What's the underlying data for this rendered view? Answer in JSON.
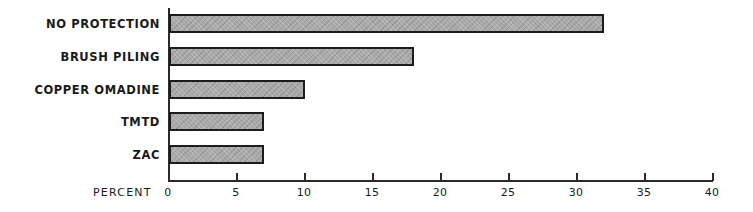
{
  "chart_data": {
    "type": "bar",
    "orientation": "horizontal",
    "title": "",
    "categories": [
      "NO PROTECTION",
      "BRUSH PILING",
      "COPPER OMADINE",
      "TMTD",
      "ZAC"
    ],
    "values": [
      32,
      18,
      10,
      7,
      7
    ],
    "xlabel": "PERCENT",
    "ylabel": "",
    "xlim": [
      0,
      40
    ],
    "xticks": [
      0,
      5,
      10,
      15,
      20,
      25,
      30,
      35,
      40
    ],
    "grid": false,
    "legend": null,
    "bar_color": "#a9a9a9",
    "bar_edge_color": "#1c1c1c"
  },
  "axis": {
    "title": "PERCENT",
    "tick_labels": [
      "0",
      "5",
      "10",
      "15",
      "20",
      "25",
      "30",
      "35",
      "40"
    ]
  }
}
